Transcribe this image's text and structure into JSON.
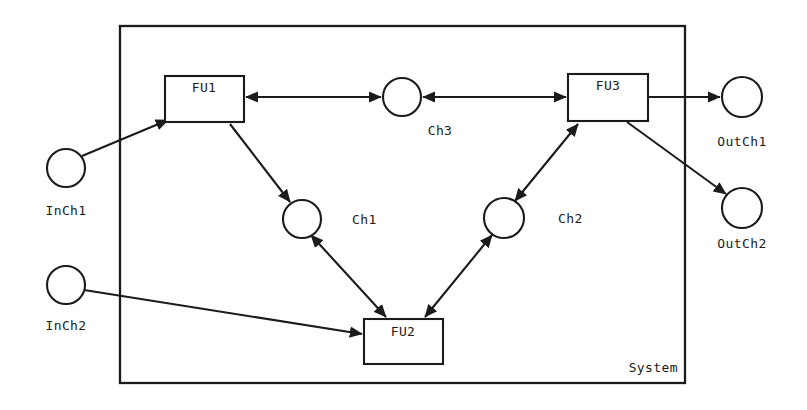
{
  "diagram": {
    "type": "block-diagram",
    "title": "System",
    "container": {
      "name": "System",
      "label": "System",
      "label_position": "bottom-right",
      "x": 120,
      "y": 26,
      "width": 565,
      "height": 357
    },
    "units": [
      {
        "id": "FU1",
        "label": "FU1",
        "shape": "rectangle",
        "x": 165,
        "y": 76,
        "width": 79,
        "height": 46,
        "label_x": 204,
        "label_y": 92
      },
      {
        "id": "FU2",
        "label": "FU2",
        "shape": "rectangle",
        "x": 364,
        "y": 319,
        "width": 79,
        "height": 45,
        "label_x": 403,
        "label_y": 336
      },
      {
        "id": "FU3",
        "label": "FU3",
        "shape": "rectangle",
        "x": 568,
        "y": 74,
        "width": 80,
        "height": 47,
        "label_x": 608,
        "label_y": 90
      }
    ],
    "channels": [
      {
        "id": "Ch1",
        "label": "Ch1",
        "shape": "circle",
        "cx": 302,
        "cy": 219,
        "r": 19,
        "label_x": 352,
        "label_y": 224,
        "scope": "internal"
      },
      {
        "id": "Ch2",
        "label": "Ch2",
        "shape": "circle",
        "cx": 504,
        "cy": 218,
        "r": 20,
        "label_x": 558,
        "label_y": 223,
        "scope": "internal"
      },
      {
        "id": "Ch3",
        "label": "Ch3",
        "shape": "circle",
        "cx": 402,
        "cy": 97,
        "r": 19,
        "label_x": 440,
        "label_y": 135,
        "scope": "internal"
      },
      {
        "id": "InCh1",
        "label": "InCh1",
        "shape": "circle",
        "cx": 66,
        "cy": 168,
        "r": 19,
        "label_x": 66,
        "label_y": 215,
        "scope": "input"
      },
      {
        "id": "InCh2",
        "label": "InCh2",
        "shape": "circle",
        "cx": 66,
        "cy": 285,
        "r": 19,
        "label_x": 66,
        "label_y": 330,
        "scope": "input"
      },
      {
        "id": "OutCh1",
        "label": "OutCh1",
        "shape": "circle",
        "cx": 742,
        "cy": 97,
        "r": 20,
        "label_x": 742,
        "label_y": 146,
        "scope": "output"
      },
      {
        "id": "OutCh2",
        "label": "OutCh2",
        "shape": "circle",
        "cx": 742,
        "cy": 208,
        "r": 20,
        "label_x": 742,
        "label_y": 248,
        "scope": "output"
      }
    ],
    "edges": [
      {
        "id": "inch1-to-fu1",
        "from": "InCh1",
        "to": "FU1",
        "arrows": "end",
        "x1": 82,
        "y1": 156,
        "x2": 168,
        "y2": 120
      },
      {
        "id": "fu1-to-ch3",
        "from": "FU1",
        "to": "Ch3",
        "arrows": "both",
        "x1": 246,
        "y1": 97,
        "x2": 381,
        "y2": 97
      },
      {
        "id": "ch3-to-fu3",
        "from": "Ch3",
        "to": "FU3",
        "arrows": "both",
        "x1": 423,
        "y1": 97,
        "x2": 566,
        "y2": 97
      },
      {
        "id": "fu1-to-ch1",
        "from": "FU1",
        "to": "Ch1",
        "arrows": "end",
        "x1": 230,
        "y1": 124,
        "x2": 290,
        "y2": 202
      },
      {
        "id": "ch1-to-fu2",
        "from": "Ch1",
        "to": "FU2",
        "arrows": "both",
        "x1": 311,
        "y1": 235,
        "x2": 386,
        "y2": 317
      },
      {
        "id": "fu2-to-ch2",
        "from": "FU2",
        "to": "Ch2",
        "arrows": "both",
        "x1": 425,
        "y1": 317,
        "x2": 492,
        "y2": 235
      },
      {
        "id": "ch2-to-fu3",
        "from": "Ch2",
        "to": "FU3",
        "arrows": "both",
        "x1": 515,
        "y1": 201,
        "x2": 578,
        "y2": 124
      },
      {
        "id": "inch2-to-fu2",
        "from": "InCh2",
        "to": "FU2",
        "arrows": "end",
        "x1": 84,
        "y1": 290,
        "x2": 362,
        "y2": 334
      },
      {
        "id": "fu3-to-outch1",
        "from": "FU3",
        "to": "OutCh1",
        "arrows": "end",
        "x1": 648,
        "y1": 97,
        "x2": 720,
        "y2": 97
      },
      {
        "id": "fu3-to-outch2",
        "from": "FU3",
        "to": "OutCh2",
        "arrows": "end",
        "x1": 627,
        "y1": 122,
        "x2": 726,
        "y2": 194
      }
    ],
    "colors": {
      "stroke": "#1b1b1b",
      "fill": "#ffffff",
      "background": "#ffffff"
    }
  }
}
